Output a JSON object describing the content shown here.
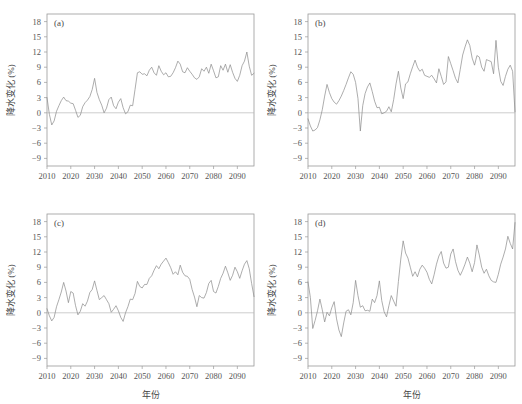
{
  "figure": {
    "background": "#ffffff",
    "line_color": "#8a8a8a",
    "axis_color": "#9a9a9a",
    "zero_line_color": "#b8b8b8"
  },
  "chart_data": [
    {
      "type": "line",
      "panel": "(a)",
      "title": "",
      "xlabel": "",
      "ylabel": "降水变化 (%)",
      "xlim": [
        2010,
        2097
      ],
      "ylim": [
        -10.5,
        19.5
      ],
      "xticks": [
        2010,
        2020,
        2030,
        2040,
        2050,
        2060,
        2070,
        2080,
        2090
      ],
      "yticks": [
        18,
        15,
        12,
        9,
        6,
        3,
        0,
        -3,
        -6,
        -9
      ],
      "grid": false,
      "legend": "none",
      "zero_reference": 0,
      "x": [
        2010,
        2011,
        2012,
        2013,
        2014,
        2015,
        2016,
        2017,
        2018,
        2019,
        2020,
        2021,
        2022,
        2023,
        2024,
        2025,
        2026,
        2027,
        2028,
        2029,
        2030,
        2031,
        2032,
        2033,
        2034,
        2035,
        2036,
        2037,
        2038,
        2039,
        2040,
        2041,
        2042,
        2043,
        2044,
        2045,
        2046,
        2047,
        2048,
        2049,
        2050,
        2051,
        2052,
        2053,
        2054,
        2055,
        2056,
        2057,
        2058,
        2059,
        2060,
        2061,
        2062,
        2063,
        2064,
        2065,
        2066,
        2067,
        2068,
        2069,
        2070,
        2071,
        2072,
        2073,
        2074,
        2075,
        2076,
        2077,
        2078,
        2079,
        2080,
        2081,
        2082,
        2083,
        2084,
        2085,
        2086,
        2087,
        2088,
        2089,
        2090,
        2091,
        2092,
        2093,
        2094,
        2095,
        2096,
        2097
      ],
      "values": [
        3.0,
        -0.3,
        -2.4,
        -1.6,
        0.3,
        1.4,
        2.4,
        3.1,
        2.4,
        2.3,
        1.9,
        1.8,
        0.5,
        -0.9,
        -0.5,
        1.2,
        2.0,
        2.5,
        3.2,
        4.6,
        6.8,
        4.0,
        2.6,
        1.5,
        0.0,
        0.9,
        2.6,
        3.1,
        1.4,
        0.8,
        2.1,
        2.8,
        1.0,
        -0.2,
        0.2,
        1.5,
        1.4,
        4.6,
        7.9,
        8.1,
        7.6,
        7.7,
        7.3,
        8.4,
        9.0,
        7.9,
        7.4,
        9.3,
        8.2,
        7.5,
        7.9,
        7.1,
        7.2,
        7.9,
        8.9,
        10.2,
        9.6,
        8.1,
        7.9,
        8.9,
        8.2,
        7.6,
        6.9,
        6.6,
        7.1,
        8.7,
        8.2,
        9.0,
        7.8,
        9.6,
        8.3,
        6.9,
        7.1,
        9.3,
        8.4,
        9.6,
        8.0,
        9.5,
        8.0,
        6.8,
        6.2,
        7.4,
        9.3,
        10.2,
        12.0,
        9.2,
        7.4,
        7.8
      ]
    },
    {
      "type": "line",
      "panel": "(b)",
      "title": "",
      "xlabel": "",
      "ylabel": "降水变化 (%)",
      "xlim": [
        2010,
        2097
      ],
      "ylim": [
        -10.5,
        19.5
      ],
      "xticks": [
        2010,
        2020,
        2030,
        2040,
        2050,
        2060,
        2070,
        2080,
        2090
      ],
      "yticks": [
        18,
        15,
        12,
        9,
        6,
        3,
        0,
        -3,
        -6,
        -9
      ],
      "grid": false,
      "legend": "none",
      "zero_reference": 0,
      "x": [
        2010,
        2011,
        2012,
        2013,
        2014,
        2015,
        2016,
        2017,
        2018,
        2019,
        2020,
        2021,
        2022,
        2023,
        2024,
        2025,
        2026,
        2027,
        2028,
        2029,
        2030,
        2031,
        2032,
        2033,
        2034,
        2035,
        2036,
        2037,
        2038,
        2039,
        2040,
        2041,
        2042,
        2043,
        2044,
        2045,
        2046,
        2047,
        2048,
        2049,
        2050,
        2051,
        2052,
        2053,
        2054,
        2055,
        2056,
        2057,
        2058,
        2059,
        2060,
        2061,
        2062,
        2063,
        2064,
        2065,
        2066,
        2067,
        2068,
        2069,
        2070,
        2071,
        2072,
        2073,
        2074,
        2075,
        2076,
        2077,
        2078,
        2079,
        2080,
        2081,
        2082,
        2083,
        2084,
        2085,
        2086,
        2087,
        2088,
        2089,
        2090,
        2091,
        2092,
        2093,
        2094,
        2095,
        2096,
        2097
      ],
      "values": [
        -1.2,
        -2.6,
        -3.6,
        -3.4,
        -2.9,
        -1.4,
        0.6,
        3.3,
        5.6,
        4.0,
        2.8,
        2.1,
        1.7,
        2.4,
        3.3,
        4.4,
        5.6,
        6.9,
        8.1,
        7.6,
        6.0,
        2.8,
        -3.6,
        1.4,
        3.8,
        5.1,
        5.9,
        4.2,
        2.3,
        1.0,
        1.1,
        -0.2,
        0.0,
        0.3,
        1.2,
        0.2,
        2.6,
        5.7,
        8.2,
        4.9,
        2.8,
        5.7,
        6.1,
        7.7,
        9.1,
        10.4,
        9.0,
        8.2,
        8.6,
        7.4,
        7.2,
        7.0,
        7.4,
        6.7,
        5.9,
        8.7,
        7.2,
        5.6,
        6.1,
        11.1,
        9.7,
        8.3,
        6.8,
        5.9,
        8.6,
        11.4,
        13.0,
        14.4,
        13.3,
        10.8,
        9.4,
        11.3,
        11.0,
        9.0,
        8.2,
        10.5,
        10.3,
        10.1,
        7.7,
        14.3,
        9.0,
        6.2,
        5.4,
        7.2,
        8.6,
        9.4,
        8.2,
        0.2
      ]
    },
    {
      "type": "line",
      "panel": "(c)",
      "title": "",
      "xlabel": "年份",
      "ylabel": "降水变化 (%)",
      "xlim": [
        2010,
        2097
      ],
      "ylim": [
        -10.5,
        19.5
      ],
      "xticks": [
        2010,
        2020,
        2030,
        2040,
        2050,
        2060,
        2070,
        2080,
        2090
      ],
      "yticks": [
        18,
        15,
        12,
        9,
        6,
        3,
        0,
        -3,
        -6,
        -9
      ],
      "grid": false,
      "legend": "none",
      "zero_reference": 0,
      "x": [
        2010,
        2011,
        2012,
        2013,
        2014,
        2015,
        2016,
        2017,
        2018,
        2019,
        2020,
        2021,
        2022,
        2023,
        2024,
        2025,
        2026,
        2027,
        2028,
        2029,
        2030,
        2031,
        2032,
        2033,
        2034,
        2035,
        2036,
        2037,
        2038,
        2039,
        2040,
        2041,
        2042,
        2043,
        2044,
        2045,
        2046,
        2047,
        2048,
        2049,
        2050,
        2051,
        2052,
        2053,
        2054,
        2055,
        2056,
        2057,
        2058,
        2059,
        2060,
        2061,
        2062,
        2063,
        2064,
        2065,
        2066,
        2067,
        2068,
        2069,
        2070,
        2071,
        2072,
        2073,
        2074,
        2075,
        2076,
        2077,
        2078,
        2079,
        2080,
        2081,
        2082,
        2083,
        2084,
        2085,
        2086,
        2087,
        2088,
        2089,
        2090,
        2091,
        2092,
        2093,
        2094,
        2095,
        2096,
        2097
      ],
      "values": [
        0.8,
        -0.6,
        -1.6,
        -0.9,
        1.2,
        2.6,
        4.1,
        6.0,
        4.3,
        2.0,
        4.2,
        3.9,
        1.4,
        -0.4,
        0.3,
        1.8,
        1.3,
        2.3,
        4.0,
        4.6,
        6.3,
        4.4,
        2.6,
        3.0,
        3.4,
        2.6,
        1.8,
        0.1,
        0.7,
        1.4,
        0.4,
        -0.9,
        -1.7,
        0.0,
        1.2,
        2.7,
        2.6,
        3.8,
        6.2,
        5.2,
        4.9,
        5.6,
        5.6,
        6.8,
        7.3,
        8.4,
        9.3,
        8.7,
        9.6,
        10.2,
        10.8,
        9.9,
        8.9,
        7.6,
        8.1,
        7.5,
        9.4,
        8.0,
        7.3,
        7.2,
        6.6,
        4.6,
        3.1,
        1.2,
        3.4,
        3.0,
        2.9,
        4.0,
        5.8,
        6.4,
        4.2,
        3.9,
        5.2,
        6.8,
        7.8,
        9.2,
        7.9,
        6.4,
        7.4,
        9.0,
        8.1,
        6.8,
        8.3,
        9.6,
        10.3,
        8.7,
        5.8,
        3.2
      ]
    },
    {
      "type": "line",
      "panel": "(d)",
      "title": "",
      "xlabel": "年份",
      "ylabel": "降水变化 (%)",
      "xlim": [
        2010,
        2097
      ],
      "ylim": [
        -10.5,
        19.5
      ],
      "xticks": [
        2010,
        2020,
        2030,
        2040,
        2050,
        2060,
        2070,
        2080,
        2090
      ],
      "yticks": [
        18,
        15,
        12,
        9,
        6,
        3,
        0,
        -3,
        -6,
        -9
      ],
      "grid": false,
      "legend": "none",
      "zero_reference": 0,
      "x": [
        2010,
        2011,
        2012,
        2013,
        2014,
        2015,
        2016,
        2017,
        2018,
        2019,
        2020,
        2021,
        2022,
        2023,
        2024,
        2025,
        2026,
        2027,
        2028,
        2029,
        2030,
        2031,
        2032,
        2033,
        2034,
        2035,
        2036,
        2037,
        2038,
        2039,
        2040,
        2041,
        2042,
        2043,
        2044,
        2045,
        2046,
        2047,
        2048,
        2049,
        2050,
        2051,
        2052,
        2053,
        2054,
        2055,
        2056,
        2057,
        2058,
        2059,
        2060,
        2061,
        2062,
        2063,
        2064,
        2065,
        2066,
        2067,
        2068,
        2069,
        2070,
        2071,
        2072,
        2073,
        2074,
        2075,
        2076,
        2077,
        2078,
        2079,
        2080,
        2081,
        2082,
        2083,
        2084,
        2085,
        2086,
        2087,
        2088,
        2089,
        2090,
        2091,
        2092,
        2093,
        2094,
        2095,
        2096,
        2097
      ],
      "values": [
        6.1,
        3.0,
        -3.1,
        -1.5,
        0.4,
        2.7,
        0.6,
        -1.8,
        0.1,
        -0.6,
        1.0,
        2.2,
        -1.2,
        -3.4,
        -4.7,
        -2.0,
        0.3,
        0.6,
        -0.4,
        2.0,
        6.4,
        3.4,
        1.1,
        1.4,
        0.4,
        0.5,
        0.3,
        2.7,
        2.0,
        3.4,
        6.3,
        2.4,
        0.2,
        -0.8,
        1.4,
        3.4,
        2.3,
        1.3,
        6.2,
        10.6,
        14.2,
        11.8,
        10.8,
        9.0,
        7.2,
        8.1,
        7.1,
        8.6,
        9.4,
        8.8,
        8.0,
        6.6,
        5.7,
        7.5,
        9.6,
        11.2,
        12.1,
        9.8,
        8.8,
        9.0,
        11.6,
        12.6,
        10.1,
        8.4,
        7.4,
        8.4,
        9.6,
        11.0,
        9.8,
        8.1,
        9.9,
        13.4,
        11.4,
        9.0,
        7.8,
        8.6,
        7.3,
        6.4,
        6.1,
        6.0,
        7.6,
        9.6,
        11.0,
        12.6,
        15.1,
        13.7,
        12.6,
        17.8
      ]
    }
  ]
}
